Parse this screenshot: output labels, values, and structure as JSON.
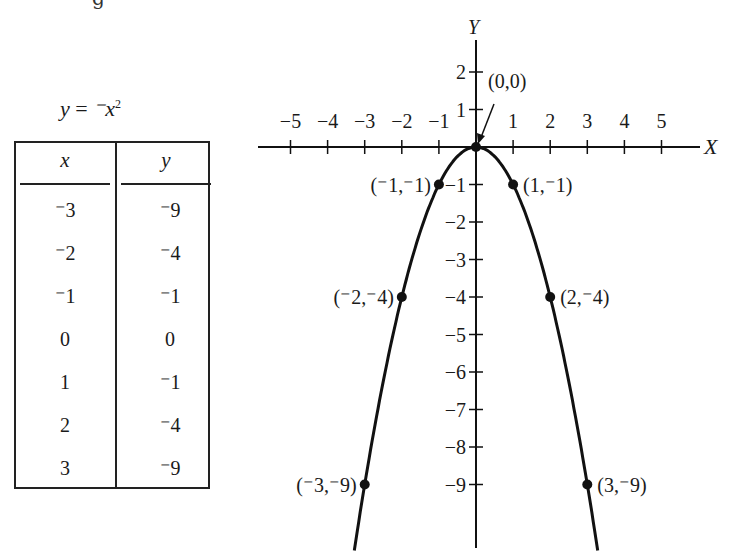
{
  "page": {
    "top_fragment": "g"
  },
  "table": {
    "equation_lhs": "y",
    "equation_eq": " = ",
    "equation_rhs": "⁻x",
    "equation_exp": "2",
    "headers": {
      "x": "x",
      "y": "y"
    },
    "rows": [
      {
        "x": "⁻3",
        "y": "⁻9"
      },
      {
        "x": "⁻2",
        "y": "⁻4"
      },
      {
        "x": "⁻1",
        "y": "⁻1"
      },
      {
        "x": "0",
        "y": "0"
      },
      {
        "x": "1",
        "y": "⁻1"
      },
      {
        "x": "2",
        "y": "⁻4"
      },
      {
        "x": "3",
        "y": "⁻9"
      }
    ]
  },
  "chart_data": {
    "type": "line",
    "xlabel": "X",
    "ylabel": "Y",
    "x": [
      -3,
      -2,
      -1,
      0,
      1,
      2,
      3
    ],
    "series": [
      {
        "name": "y = -x^2",
        "values": [
          -9,
          -4,
          -1,
          0,
          -1,
          -4,
          -9
        ]
      }
    ],
    "xlim": [
      -5,
      5
    ],
    "ylim": [
      -10,
      2
    ],
    "x_ticks": [
      -5,
      -4,
      -3,
      -2,
      -1,
      1,
      2,
      3,
      4,
      5
    ],
    "x_tick_labels": [
      "−5",
      "−4",
      "−3",
      "−2",
      "−1",
      "1",
      "2",
      "3",
      "4",
      "5"
    ],
    "y_ticks": [
      2,
      1,
      -1,
      -2,
      -3,
      -4,
      -5,
      -6,
      -7,
      -8,
      -9
    ],
    "y_tick_labels": [
      "2",
      "1",
      "−1",
      "−2",
      "−3",
      "−4",
      "−5",
      "−6",
      "−7",
      "−8",
      "−9"
    ],
    "annotations": [
      {
        "x": 0,
        "y": 0,
        "text": "(0,0)"
      },
      {
        "x": -1,
        "y": -1,
        "text": "(⁻1,⁻1)"
      },
      {
        "x": 1,
        "y": -1,
        "text": "(1,⁻1)"
      },
      {
        "x": -2,
        "y": -4,
        "text": "(⁻2,⁻4)"
      },
      {
        "x": 2,
        "y": -4,
        "text": "(2,⁻4)"
      },
      {
        "x": -3,
        "y": -9,
        "text": "(⁻3,⁻9)"
      },
      {
        "x": 3,
        "y": -9,
        "text": "(3,⁻9)"
      }
    ],
    "grid": false,
    "legend": "none",
    "line_color": "#111111"
  }
}
